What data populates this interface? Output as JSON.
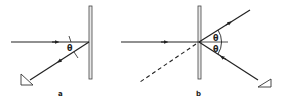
{
  "diagram": {
    "panels": [
      {
        "id": "a",
        "label": "a",
        "angle_labels": [
          "θ"
        ]
      },
      {
        "id": "b",
        "label": "b",
        "angle_labels": [
          "θ",
          "θ"
        ]
      }
    ],
    "colors": {
      "line": "#222222",
      "mirror_fill": "#e8e8e8",
      "background": "#ffffff"
    }
  }
}
